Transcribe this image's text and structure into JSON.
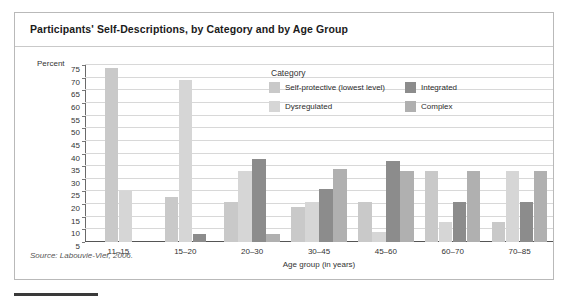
{
  "figure": {
    "title": "Participants' Self-Descriptions, by Category and by Age Group",
    "percent_axis_label": "Percent",
    "source": "Source: Labouvie-Vief, 2006."
  },
  "legend": {
    "title": "Category",
    "items": [
      {
        "label": "Self-protective (lowest level)",
        "color": "#c9c9c9"
      },
      {
        "label": "Integrated",
        "color": "#8c8c8c"
      },
      {
        "label": "Dysregulated",
        "color": "#d6d6d6"
      },
      {
        "label": "Complex",
        "color": "#b0b0b0"
      }
    ]
  },
  "chart_data": {
    "type": "bar",
    "title": "Participants' Self-Descriptions, by Category and by Age Group",
    "xlabel": "Age group (in years)",
    "ylabel": "Percent",
    "ylim": [
      5,
      75
    ],
    "ytick_step": 5,
    "yticks": [
      75,
      70,
      65,
      60,
      55,
      50,
      45,
      40,
      35,
      30,
      25,
      20,
      15,
      10,
      5
    ],
    "grid": true,
    "legend_position": "inside-top-center",
    "categories": [
      "11–15",
      "15–20",
      "20–30",
      "30–45",
      "45–60",
      "60–70",
      "70–85"
    ],
    "series": [
      {
        "name": "Self-protective (lowest level)",
        "color": "#c9c9c9",
        "values": [
          74,
          23,
          21,
          19,
          21,
          33,
          13
        ]
      },
      {
        "name": "Dysregulated",
        "color": "#d6d6d6",
        "values": [
          25,
          69,
          33,
          21,
          9,
          13,
          33
        ]
      },
      {
        "name": "Integrated",
        "color": "#8c8c8c",
        "values": [
          null,
          8,
          38,
          26,
          37,
          21,
          21
        ]
      },
      {
        "name": "Complex",
        "color": "#b0b0b0",
        "values": [
          null,
          null,
          8,
          34,
          33,
          33,
          33
        ]
      }
    ]
  }
}
